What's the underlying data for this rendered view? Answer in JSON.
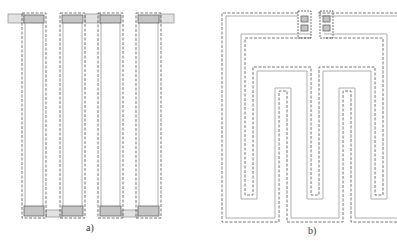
{
  "figure": {
    "panels": [
      {
        "id": "a",
        "label": "a)",
        "description": "Four parallel vertical resistor strips with contact pads top and bottom",
        "strips": [
          {
            "x": 22,
            "width": 24
          },
          {
            "x": 61,
            "width": 24
          },
          {
            "x": 99,
            "width": 24
          },
          {
            "x": 137,
            "width": 24
          }
        ],
        "top_pad_y": 14,
        "bottom_pad_y": 194,
        "pad_height": 10
      },
      {
        "id": "b",
        "label": "b)",
        "description": "Serpentine (meander) resistor layout with two contact pads at top"
      }
    ]
  },
  "colors": {
    "dashed": "#555555",
    "solid": "#999999",
    "pad_fill": "#bdbdbd",
    "connector": "#d0d0d0"
  }
}
